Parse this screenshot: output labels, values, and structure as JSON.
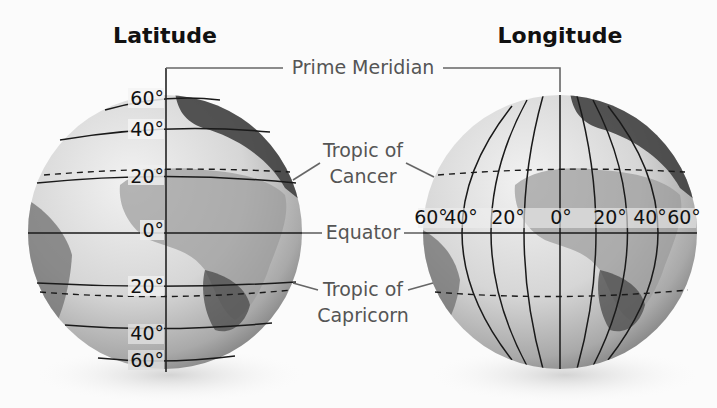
{
  "titles": {
    "latitude": "Latitude",
    "longitude": "Longitude"
  },
  "labels": {
    "prime_meridian": "Prime Meridian",
    "tropic_cancer_line1": "Tropic of",
    "tropic_cancer_line2": "Cancer",
    "equator": "Equator",
    "tropic_capricorn_line1": "Tropic of",
    "tropic_capricorn_line2": "Capricorn"
  },
  "latitude_globe": {
    "parallels": [
      {
        "label": "60°",
        "value": 60
      },
      {
        "label": "40°",
        "value": 40
      },
      {
        "label": "20°",
        "value": 20
      },
      {
        "label": "0°",
        "value": 0
      },
      {
        "label": "20°",
        "value": -20
      },
      {
        "label": "40°",
        "value": -40
      },
      {
        "label": "60°",
        "value": -60
      }
    ]
  },
  "longitude_globe": {
    "meridians": [
      {
        "label": "60°",
        "value": -60
      },
      {
        "label": "40°",
        "value": -40
      },
      {
        "label": "20°",
        "value": -20
      },
      {
        "label": "0°",
        "value": 0
      },
      {
        "label": "20°",
        "value": 20
      },
      {
        "label": "40°",
        "value": 40
      },
      {
        "label": "60°",
        "value": 60
      }
    ]
  },
  "colors": {
    "background": "#fbfbfb",
    "label_gray": "#555555",
    "line_black": "#1a1a1a"
  }
}
